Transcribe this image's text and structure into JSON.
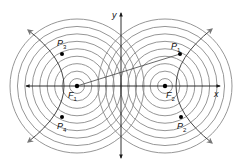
{
  "diagram": {
    "axes": {
      "x_label": "x",
      "y_label": "y"
    },
    "foci": [
      {
        "id": "F1",
        "label": "F",
        "subscript": "1"
      },
      {
        "id": "F2",
        "label": "F",
        "subscript": "2"
      }
    ],
    "points": [
      {
        "id": "P1",
        "label": "P",
        "subscript": "1"
      },
      {
        "id": "P2",
        "label": "P",
        "subscript": "2"
      },
      {
        "id": "P3",
        "label": "P",
        "subscript": "3"
      },
      {
        "id": "P4",
        "label": "P",
        "subscript": "4"
      }
    ],
    "concentric_circle_count": 9,
    "colors": {
      "circles": "#8a8a8a",
      "axes": "#1a1a1a",
      "arrowheads": "#777777",
      "points": "#000000"
    }
  }
}
